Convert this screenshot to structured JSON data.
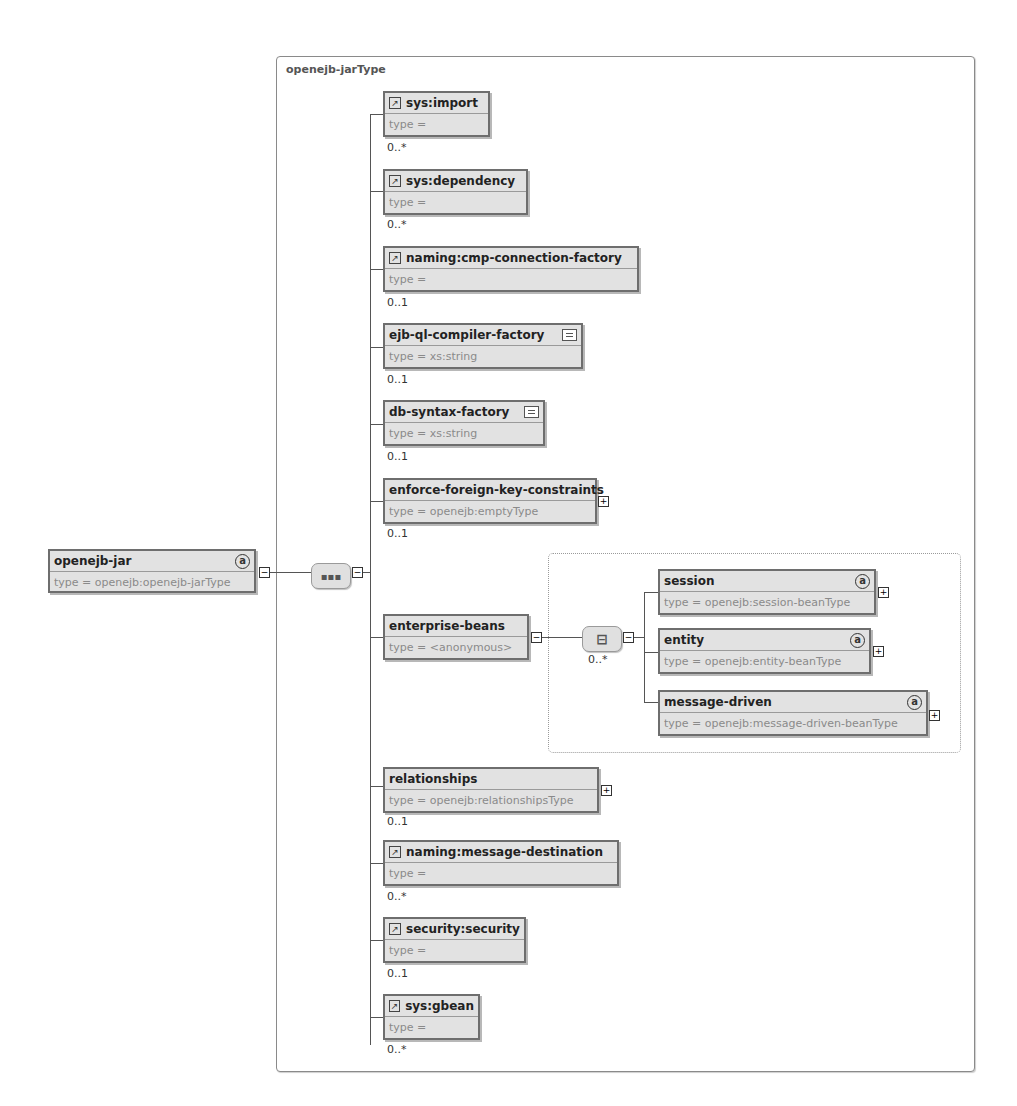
{
  "diagram": {
    "frame_title": "openejb-jarType",
    "root": {
      "name": "openejb-jar",
      "type": "type = openejb:openejb-jarType",
      "has_attributes": true,
      "attr_icon": "a"
    },
    "sequence_icon": "▪▪▪",
    "choice_icon": "⊟",
    "choice_cardinality": "0..*",
    "ref_icon": "↗",
    "expand_minus": "−",
    "expand_plus": "+",
    "children": [
      {
        "name": "sys:import",
        "type": "type =",
        "cardinality": "0..*",
        "ref": true
      },
      {
        "name": "sys:dependency",
        "type": "type =",
        "cardinality": "0..*",
        "ref": true
      },
      {
        "name": "naming:cmp-connection-factory",
        "type": "type =",
        "cardinality": "0..1",
        "ref": true
      },
      {
        "name": "ejb-ql-compiler-factory",
        "type": "type = xs:string",
        "cardinality": "0..1",
        "simple": true
      },
      {
        "name": "db-syntax-factory",
        "type": "type = xs:string",
        "cardinality": "0..1",
        "simple": true
      },
      {
        "name": "enforce-foreign-key-constraints",
        "type": "type = openejb:emptyType",
        "cardinality": "0..1",
        "expandable": true
      },
      {
        "name": "enterprise-beans",
        "type": "type = <anonymous>",
        "cardinality": "",
        "expanded": true
      },
      {
        "name": "relationships",
        "type": "type = openejb:relationshipsType",
        "cardinality": "0..1",
        "expandable": true
      },
      {
        "name": "naming:message-destination",
        "type": "type =",
        "cardinality": "0..*",
        "ref": true
      },
      {
        "name": "security:security",
        "type": "type =",
        "cardinality": "0..1",
        "ref": true
      },
      {
        "name": "sys:gbean",
        "type": "type =",
        "cardinality": "0..*",
        "ref": true
      }
    ],
    "beans": [
      {
        "name": "session",
        "type": "type = openejb:session-beanType"
      },
      {
        "name": "entity",
        "type": "type = openejb:entity-beanType"
      },
      {
        "name": "message-driven",
        "type": "type = openejb:message-driven-beanType"
      }
    ]
  }
}
